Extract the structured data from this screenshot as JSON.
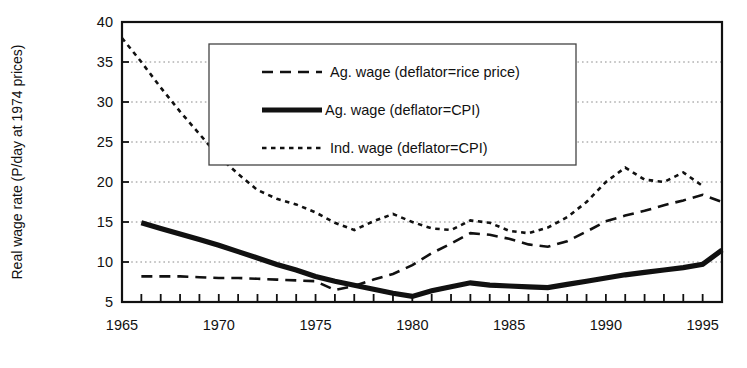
{
  "chart_data": {
    "type": "line",
    "title": "",
    "xlabel": "",
    "ylabel": "Real wage rate (P/day at 1974 prices)",
    "xlim": [
      1965,
      1996
    ],
    "ylim": [
      5,
      40
    ],
    "ytick_step": 5,
    "yticks": [
      5,
      10,
      15,
      20,
      25,
      30,
      35,
      40
    ],
    "xticks_labeled": [
      1965,
      1970,
      1975,
      1980,
      1985,
      1990,
      1995
    ],
    "xtick_minor_every": 1,
    "grid": "horizontal-dotted",
    "legend_position": "upper-center",
    "x": [
      1965,
      1966,
      1967,
      1968,
      1969,
      1970,
      1971,
      1972,
      1973,
      1974,
      1975,
      1976,
      1977,
      1978,
      1979,
      1980,
      1981,
      1982,
      1983,
      1984,
      1985,
      1986,
      1987,
      1988,
      1989,
      1990,
      1991,
      1992,
      1993,
      1994,
      1995,
      1996
    ],
    "series": [
      {
        "name": "Ag. wage (deflator=rice price)",
        "style": "dashed",
        "width": 2.6,
        "color": "#111111",
        "values": [
          null,
          8.2,
          8.2,
          8.2,
          8.1,
          8.0,
          8.0,
          7.9,
          7.8,
          7.7,
          7.6,
          6.5,
          7.0,
          7.8,
          8.5,
          9.6,
          11.1,
          12.3,
          13.6,
          13.4,
          12.9,
          12.2,
          11.9,
          12.6,
          13.8,
          15.1,
          15.8,
          16.4,
          17.1,
          17.7,
          18.4,
          17.5
        ]
      },
      {
        "name": "Ag. wage (deflator=CPI)",
        "style": "solid",
        "width": 5.2,
        "color": "#111111",
        "values": [
          null,
          14.9,
          14.2,
          13.5,
          12.8,
          12.1,
          11.3,
          10.5,
          9.7,
          9.0,
          8.2,
          7.6,
          7.1,
          6.6,
          6.1,
          5.7,
          6.4,
          6.9,
          7.4,
          7.1,
          7.0,
          6.9,
          6.8,
          7.2,
          7.6,
          8.0,
          8.4,
          8.7,
          9.0,
          9.3,
          9.7,
          11.5
        ]
      },
      {
        "name": "Ind. wage (deflator=CPI)",
        "style": "dotted",
        "width": 2.6,
        "color": "#111111",
        "values": [
          38.0,
          35.0,
          31.8,
          28.8,
          26.0,
          23.2,
          21.0,
          19.0,
          17.9,
          17.2,
          16.2,
          14.9,
          14.0,
          15.1,
          16.0,
          15.0,
          14.2,
          14.0,
          15.2,
          14.9,
          13.9,
          13.6,
          14.3,
          15.6,
          17.5,
          20.0,
          21.8,
          20.3,
          20.0,
          21.2,
          19.5,
          null
        ]
      }
    ]
  },
  "axis": {
    "y_title": "Real wage rate (P/day at 1974 prices)",
    "y_tick_labels": [
      "40",
      "35",
      "30",
      "25",
      "20",
      "15",
      "10",
      "5"
    ],
    "x_tick_labels": [
      "1965",
      "1970",
      "1975",
      "1980",
      "1985",
      "1990",
      "1995"
    ]
  },
  "legend": {
    "entries": [
      {
        "label": "Ag. wage (deflator=rice price)",
        "style": "dashed"
      },
      {
        "label": "Ag. wage (deflator=CPI)",
        "style": "solid"
      },
      {
        "label": "Ind. wage (deflator=CPI)",
        "style": "dotted"
      }
    ]
  },
  "colors": {
    "ink": "#111111",
    "grid": "#8a8a8a",
    "background": "#ffffff"
  }
}
